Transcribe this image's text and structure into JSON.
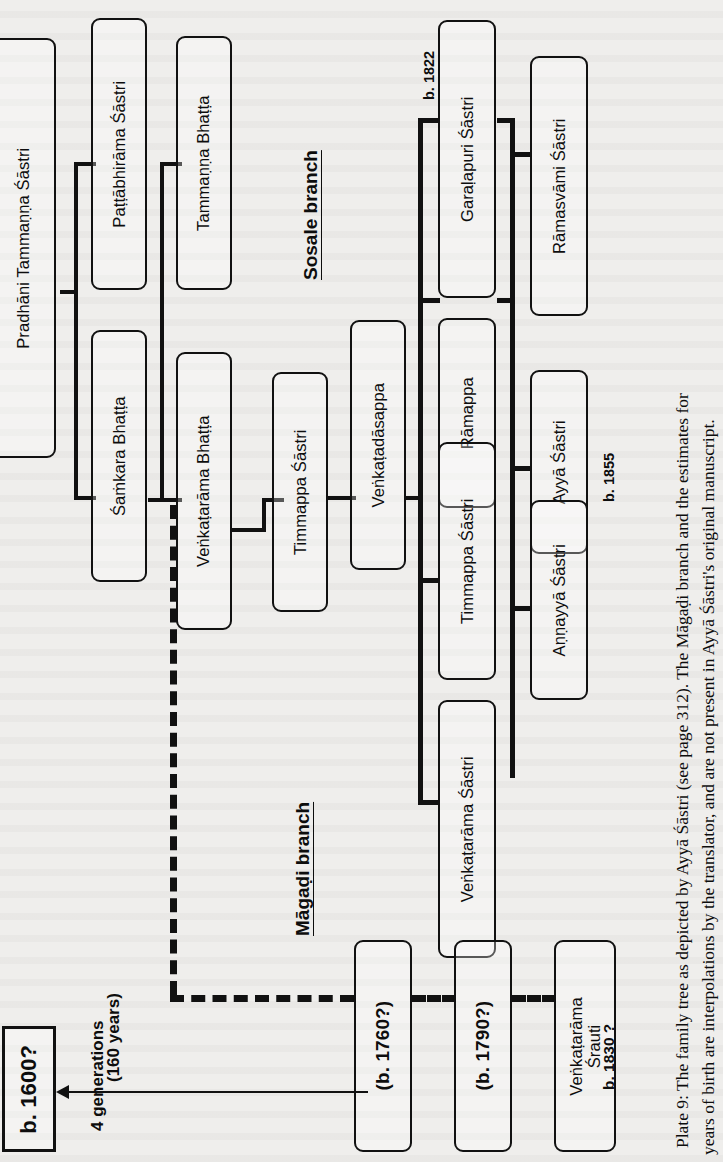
{
  "plate": {
    "caption_line1": "Plate 9:  The family tree as depicted by Ayyā Śāstri (see page 312). The Māgaḍi branch and the estimates for",
    "caption_line2": "years of birth are interpolations by the translator, and are not present in Ayyā Śāstri's original manuscript."
  },
  "branches": {
    "sosale": "Sosale branch",
    "magadi": "Māgaḍi branch"
  },
  "year_labels": {
    "b1822": "b. 1822",
    "b1855": "b. 1855",
    "b1830": "b. 1830 ?"
  },
  "generations_note": {
    "line1": "4 generations",
    "line2": "(160 years)"
  },
  "nodes": {
    "pradhani": "Pradhāni Tammaṇṇa Śāstri",
    "pattabhirama": "Paṭṭābhirāma Śāstri",
    "samkara": "Śaṁkara Bhaṭṭa",
    "tammanna_bhatta": "Tammaṇṇa Bhaṭṭa",
    "venkatarama_bhatta": "Veṅkaṭarāma Bhaṭṭa",
    "timmappa_sastri_1": "Timmappa Śāstri",
    "venkatadasappa": "Veṅkaṭadāsappa",
    "ramappa": "Rāmappa",
    "garalapuri": "Garaḷapuri Śāstri",
    "timmappa_sastri_2": "Timmappa Śāstri",
    "venkatarama_sastri": "Veṅkaṭarāma Śāstri",
    "ramasvami": "Rāmasvāmi Śāstri",
    "ayya_sastri": "Ayyā Śāstri",
    "annayya_sastri": "Aṇṇayyā Śāstri",
    "b1600": "b. 1600?",
    "b1760": "(b. 1760?)",
    "b1790": "(b. 1790?)",
    "venkatarama_srauti": "Veṅkaṭarāma Śrauti"
  },
  "colors": {
    "ink": "#111111",
    "page": "#efeeec"
  }
}
